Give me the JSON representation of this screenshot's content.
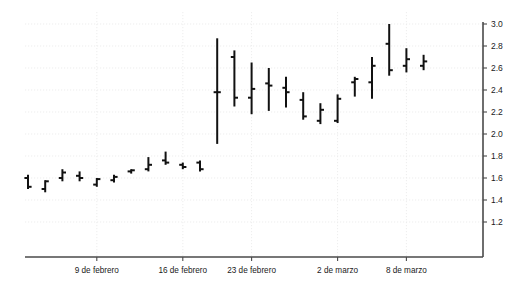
{
  "chart_data": {
    "type": "ohlc",
    "title": "",
    "subtitle": "",
    "xlabel": "",
    "ylabel": "",
    "ylim": [
      1.1,
      3.05
    ],
    "yticks": [
      1.2,
      1.4,
      1.6,
      1.8,
      2.0,
      2.2,
      2.4,
      2.6,
      2.8,
      3.0
    ],
    "ytick_labels": [
      "1.2",
      "1.4",
      "1.6",
      "1.8",
      "2.0",
      "2.2",
      "2.4",
      "2.6",
      "2.8",
      "3.0"
    ],
    "yaxis_position": "right",
    "grid": true,
    "grid_style": "dotted",
    "legend": null,
    "xtick_labels": [
      "9 de febrero",
      "16 de febrero",
      "23 de febrero",
      "2 de marzo",
      "8 de marzo"
    ],
    "xtick_indices": [
      4,
      9,
      13,
      18,
      22
    ],
    "series_color": "#111111",
    "bars": [
      {
        "index": 0,
        "open": 1.6,
        "high": 1.63,
        "low": 1.5,
        "close": 1.52
      },
      {
        "index": 1,
        "open": 1.5,
        "high": 1.58,
        "low": 1.47,
        "close": 1.57
      },
      {
        "index": 2,
        "open": 1.6,
        "high": 1.68,
        "low": 1.57,
        "close": 1.65
      },
      {
        "index": 3,
        "open": 1.62,
        "high": 1.66,
        "low": 1.57,
        "close": 1.6
      },
      {
        "index": 4,
        "open": 1.54,
        "high": 1.6,
        "low": 1.52,
        "close": 1.59
      },
      {
        "index": 5,
        "open": 1.58,
        "high": 1.63,
        "low": 1.56,
        "close": 1.61
      },
      {
        "index": 6,
        "open": 1.66,
        "high": 1.68,
        "low": 1.64,
        "close": 1.67
      },
      {
        "index": 7,
        "open": 1.68,
        "high": 1.79,
        "low": 1.66,
        "close": 1.72
      },
      {
        "index": 8,
        "open": 1.76,
        "high": 1.84,
        "low": 1.72,
        "close": 1.74
      },
      {
        "index": 9,
        "open": 1.72,
        "high": 1.74,
        "low": 1.68,
        "close": 1.7
      },
      {
        "index": 10,
        "open": 1.74,
        "high": 1.76,
        "low": 1.66,
        "close": 1.68
      },
      {
        "index": 11,
        "open": 2.38,
        "high": 2.87,
        "low": 1.91,
        "close": 2.38
      },
      {
        "index": 12,
        "open": 2.7,
        "high": 2.76,
        "low": 2.25,
        "close": 2.33
      },
      {
        "index": 13,
        "open": 2.33,
        "high": 2.65,
        "low": 2.18,
        "close": 2.41
      },
      {
        "index": 14,
        "open": 2.46,
        "high": 2.6,
        "low": 2.21,
        "close": 2.44
      },
      {
        "index": 15,
        "open": 2.42,
        "high": 2.52,
        "low": 2.24,
        "close": 2.38
      },
      {
        "index": 16,
        "open": 2.31,
        "high": 2.38,
        "low": 2.13,
        "close": 2.16
      },
      {
        "index": 17,
        "open": 2.12,
        "high": 2.28,
        "low": 2.09,
        "close": 2.22
      },
      {
        "index": 18,
        "open": 2.12,
        "high": 2.36,
        "low": 2.1,
        "close": 2.32
      },
      {
        "index": 19,
        "open": 2.47,
        "high": 2.52,
        "low": 2.34,
        "close": 2.5
      },
      {
        "index": 20,
        "open": 2.47,
        "high": 2.7,
        "low": 2.32,
        "close": 2.62
      },
      {
        "index": 21,
        "open": 2.82,
        "high": 3.0,
        "low": 2.53,
        "close": 2.58
      },
      {
        "index": 22,
        "open": 2.62,
        "high": 2.78,
        "low": 2.56,
        "close": 2.68
      },
      {
        "index": 23,
        "open": 2.62,
        "high": 2.72,
        "low": 2.58,
        "close": 2.66
      }
    ]
  },
  "axis": {
    "y_axis_label": "",
    "x_axis_label": ""
  }
}
